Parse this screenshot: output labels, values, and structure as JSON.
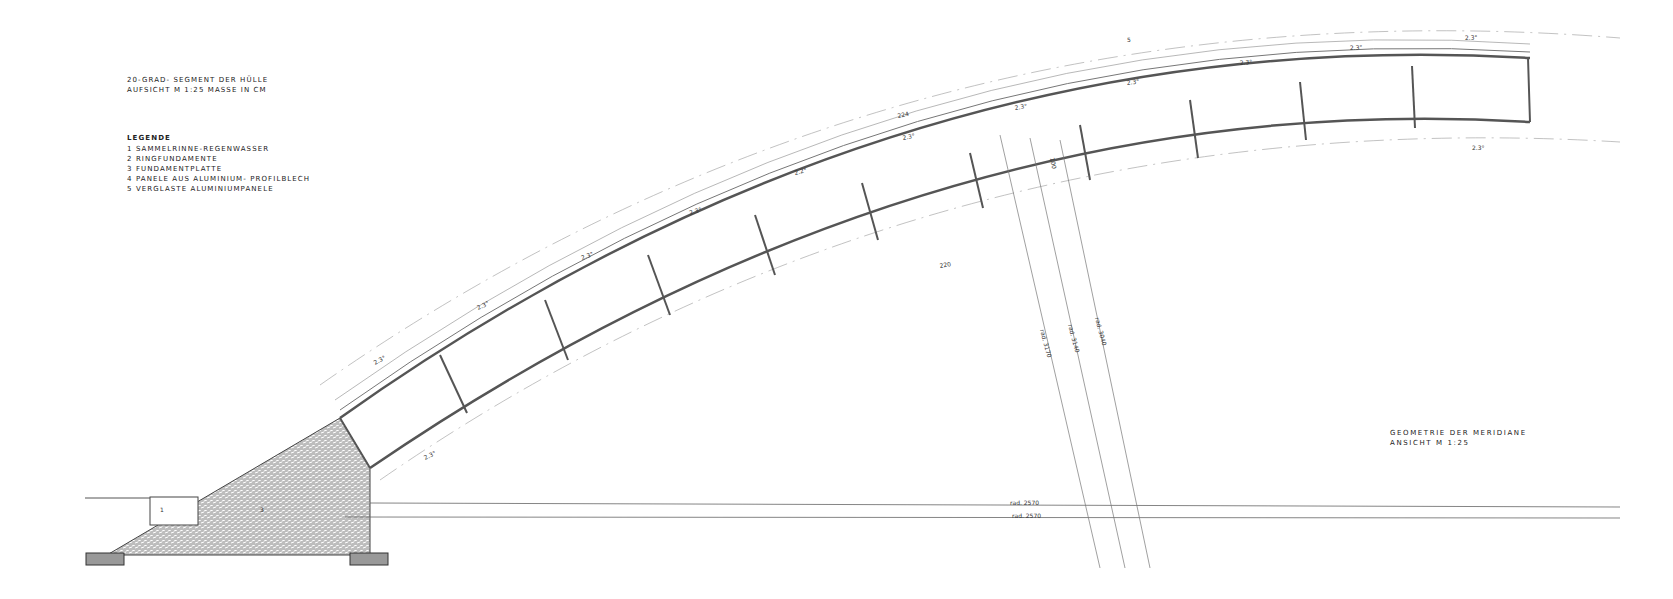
{
  "title_block": {
    "line1": "20-GRAD- SEGMENT DER HÜLLE",
    "line2": "AUFSICHT   M 1:25   MASSE IN CM"
  },
  "legend": {
    "heading": "LEGENDE",
    "items": [
      "1 SAMMELRINNE-REGENWASSER",
      "2 RINGFUNDAMENTE",
      "3 FUNDAMENTPLATTE",
      "4 PANELE AUS ALUMINIUM- PROFILBLECH",
      "5 VERGLASTE ALUMINIUMPANELE"
    ]
  },
  "geometry_block": {
    "line1": "GEOMETRIE DER MERIDIANE",
    "line2": "ANSICHT   M 1:25"
  },
  "annotations": {
    "angles": [
      "2.3°",
      "2.3°",
      "2.3°",
      "2.2°",
      "2.3°",
      "2.3°",
      "2.3°",
      "2.3°",
      "2.3°",
      "2.3°",
      "2.3°",
      "2.3°"
    ],
    "inner_angles": [
      "2.3°",
      "2.3°"
    ],
    "dim_224": "224",
    "dim_220": "220",
    "dim_100": "100",
    "radius_labels": [
      "rad. 3170",
      "rad. 3140",
      "rad. 3040"
    ],
    "horizontal_radius": [
      "rad. 2570",
      "rad. 2570"
    ],
    "marker_top": "5",
    "marker_gutter": "1",
    "marker_foundation": "3"
  },
  "colors": {
    "line": "#555555",
    "hatch": "#9a9a9a"
  }
}
